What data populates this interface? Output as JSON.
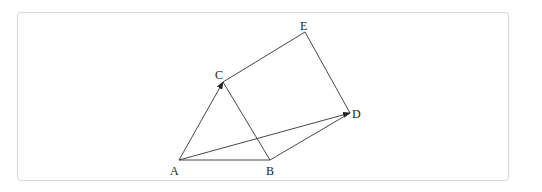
{
  "diagram": {
    "type": "geometry-vector-figure",
    "points": {
      "A": {
        "label": "A",
        "x": 179,
        "y": 160,
        "lx": 170,
        "ly": 175
      },
      "B": {
        "label": "B",
        "x": 270,
        "y": 160,
        "lx": 266,
        "ly": 175
      },
      "C": {
        "label": "C",
        "x": 223,
        "y": 82,
        "lx": 215,
        "ly": 79
      },
      "D": {
        "label": "D",
        "x": 350,
        "y": 113,
        "lx": 352,
        "ly": 118
      },
      "E": {
        "label": "E",
        "x": 305,
        "y": 32,
        "lx": 300,
        "ly": 30
      }
    },
    "segments": [
      {
        "from": "A",
        "to": "B",
        "arrow": false
      },
      {
        "from": "A",
        "to": "C",
        "arrow": true
      },
      {
        "from": "A",
        "to": "D",
        "arrow": true
      },
      {
        "from": "B",
        "to": "C",
        "arrow": false
      },
      {
        "from": "B",
        "to": "D",
        "arrow": false
      },
      {
        "from": "C",
        "to": "E",
        "arrow": false
      },
      {
        "from": "E",
        "to": "D",
        "arrow": false
      }
    ],
    "colors": {
      "line": "#333333",
      "frame": "#d9d9d9"
    }
  }
}
